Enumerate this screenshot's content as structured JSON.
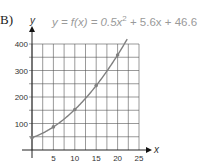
{
  "problem_label": "B)",
  "equation": {
    "prefix": "y = f(x) = 0.5x",
    "exp": "2",
    "suffix": " + 5.6x + 46.6"
  },
  "chart_data": {
    "type": "line",
    "xlabel": "x",
    "ylabel": "y",
    "xlim": [
      0,
      25
    ],
    "ylim": [
      0,
      400
    ],
    "x_ticks": [
      5,
      10,
      15,
      20,
      25
    ],
    "y_ticks": [
      100,
      200,
      300,
      400
    ],
    "grid": true,
    "legend": null,
    "series": [
      {
        "name": "f(x)",
        "color": "#808080",
        "x": [
          0,
          5,
          10,
          15,
          20
        ],
        "values": [
          46.6,
          87.1,
          152.6,
          243.1,
          358.6
        ],
        "markers": true
      }
    ]
  }
}
